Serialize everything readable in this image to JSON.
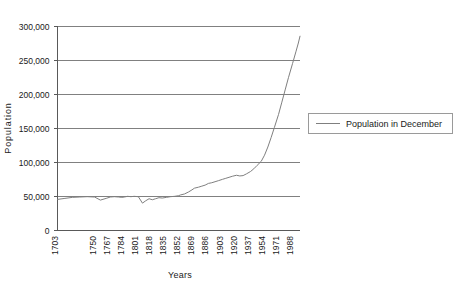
{
  "chart_data": {
    "type": "line",
    "title": "",
    "xlabel": "Years",
    "ylabel": "Population",
    "ylim": [
      0,
      300000
    ],
    "ytick_labels": [
      "0",
      "50,000",
      "100,000",
      "150,000",
      "200,000",
      "250,000",
      "300,000"
    ],
    "ytick_values": [
      0,
      50000,
      100000,
      150000,
      200000,
      250000,
      300000
    ],
    "xtick_labels": [
      "1703",
      "1750",
      "1767",
      "1784",
      "1801",
      "1818",
      "1835",
      "1852",
      "1869",
      "1886",
      "1903",
      "1920",
      "1937",
      "1954",
      "1971",
      "1988"
    ],
    "xtick_values": [
      1703,
      1750,
      1767,
      1784,
      1801,
      1818,
      1835,
      1852,
      1869,
      1886,
      1903,
      1920,
      1937,
      1954,
      1971,
      1988
    ],
    "xlim": [
      1703,
      1997
    ],
    "grid": "horizontal",
    "legend_position": "right",
    "series": [
      {
        "name": "Population in December",
        "color": "#7f7f7f",
        "x": [
          1703,
          1712,
          1721,
          1730,
          1739,
          1748,
          1755,
          1762,
          1767,
          1772,
          1777,
          1781,
          1784,
          1788,
          1792,
          1796,
          1801,
          1806,
          1810,
          1814,
          1818,
          1822,
          1826,
          1830,
          1835,
          1840,
          1845,
          1850,
          1852,
          1857,
          1862,
          1866,
          1869,
          1874,
          1878,
          1882,
          1886,
          1890,
          1894,
          1898,
          1903,
          1907,
          1911,
          1915,
          1920,
          1924,
          1928,
          1932,
          1937,
          1941,
          1945,
          1950,
          1954,
          1958,
          1962,
          1966,
          1971,
          1975,
          1979,
          1983,
          1988,
          1992,
          1995,
          1997
        ],
        "y": [
          45000,
          46500,
          48000,
          48500,
          49000,
          48500,
          44000,
          46500,
          48500,
          49000,
          48500,
          48000,
          48500,
          49500,
          49000,
          49500,
          49000,
          39500,
          43000,
          46000,
          44500,
          46000,
          47500,
          47000,
          48000,
          49000,
          49500,
          50500,
          51500,
          53000,
          56000,
          59000,
          61500,
          63000,
          64500,
          66000,
          68500,
          69500,
          71000,
          72500,
          74500,
          76000,
          77500,
          79000,
          80500,
          79500,
          80000,
          82500,
          86000,
          90000,
          95000,
          101000,
          110000,
          122000,
          136000,
          151000,
          170000,
          188000,
          206000,
          224000,
          245000,
          262000,
          275000,
          285000
        ]
      }
    ]
  },
  "legend": {
    "entries": [
      {
        "label": "Population in December"
      }
    ]
  }
}
